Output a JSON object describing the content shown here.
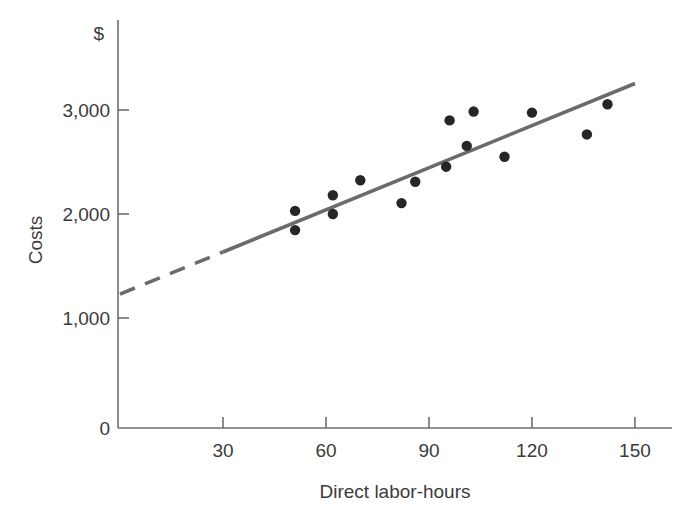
{
  "chart_data": {
    "type": "scatter",
    "title": "",
    "xlabel": "Direct labor-hours",
    "ylabel": "Costs",
    "y_unit_symbol": "$",
    "xlim": [
      0,
      160
    ],
    "ylim": [
      0,
      3500
    ],
    "xticks": [
      30,
      60,
      90,
      120,
      150
    ],
    "xtick_labels": [
      "30",
      "60",
      "90",
      "120",
      "150"
    ],
    "yticks": [
      0,
      1000,
      2000,
      3000
    ],
    "ytick_labels": [
      "0",
      "1,000",
      "2,000",
      "3,000"
    ],
    "grid": false,
    "legend": "none",
    "points": [
      {
        "x": 51,
        "y": 2030
      },
      {
        "x": 51,
        "y": 1845
      },
      {
        "x": 62,
        "y": 2180
      },
      {
        "x": 62,
        "y": 2000
      },
      {
        "x": 70,
        "y": 2325
      },
      {
        "x": 82,
        "y": 2105
      },
      {
        "x": 86,
        "y": 2310
      },
      {
        "x": 95,
        "y": 2455
      },
      {
        "x": 96,
        "y": 2900
      },
      {
        "x": 101,
        "y": 2655
      },
      {
        "x": 103,
        "y": 2985
      },
      {
        "x": 112,
        "y": 2550
      },
      {
        "x": 120,
        "y": 2975
      },
      {
        "x": 136,
        "y": 2765
      },
      {
        "x": 142,
        "y": 3055
      }
    ],
    "fit_line": {
      "label": "least-squares cost line",
      "intercept": 1230,
      "slope": 13.5,
      "dashed_segment": {
        "x_start": 0,
        "x_end": 30
      },
      "solid_segment": {
        "x_start": 30,
        "x_end": 150
      },
      "style_dashed": "dashed extrapolation below relevant range",
      "style_solid": "solid within relevant range"
    },
    "colors": {
      "point": "#262626",
      "line": "#6b6b6b",
      "axis": "#6e6e6e",
      "text": "#3b3b3b",
      "background": "#ffffff"
    }
  }
}
